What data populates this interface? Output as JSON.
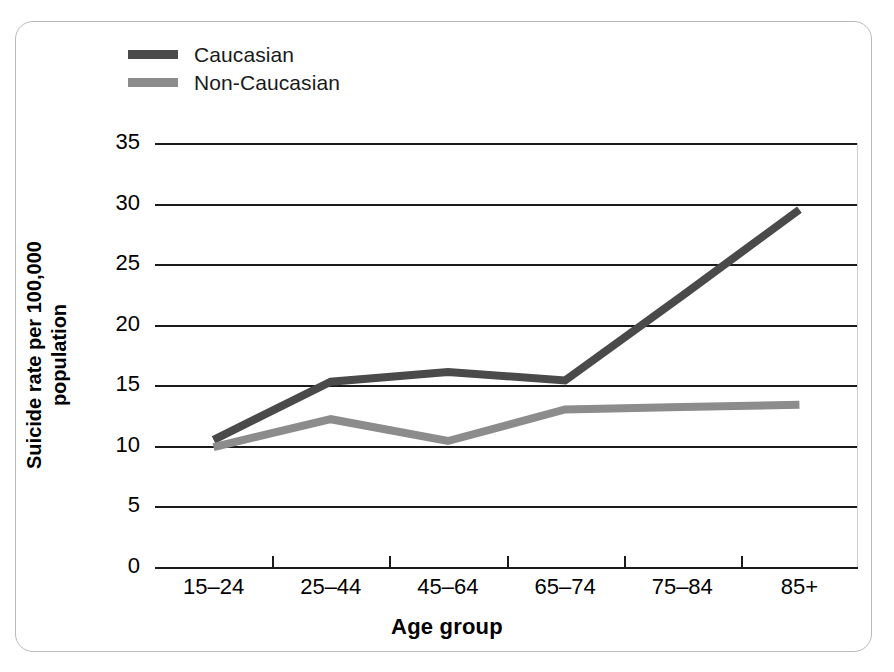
{
  "figure": {
    "border_color": "#b9b9b9",
    "background": "#ffffff"
  },
  "legend": {
    "position": "top-left inside plot",
    "entries": [
      {
        "label": "Caucasian",
        "color": "#4a4a4a",
        "swatch": "legend-swatch-caucasian"
      },
      {
        "label": "Non-Caucasian",
        "color": "#8c8c8c",
        "swatch": "legend-swatch-non-caucasian"
      }
    ]
  },
  "axes": {
    "x_title": "Age group",
    "y_title_line1": "Suicide rate per 100,000",
    "y_title_line2": "population",
    "y_ticks": [
      "35",
      "30",
      "25",
      "20",
      "15",
      "10",
      "5",
      "0"
    ],
    "x_ticks": [
      "15–24",
      "25–44",
      "45–64",
      "65–74",
      "75–84",
      "85+"
    ]
  },
  "chart_data": {
    "type": "line",
    "title": "",
    "xlabel": "Age group",
    "ylabel": "Suicide rate per 100,000 population",
    "categories": [
      "15–24",
      "25–44",
      "45–64",
      "65–74",
      "75–84",
      "85+"
    ],
    "ylim": [
      0,
      35
    ],
    "ytick_step": 5,
    "grid": "horizontal",
    "legend_position": "top-left",
    "series": [
      {
        "name": "Caucasian",
        "color": "#4a4a4a",
        "values": [
          10.5,
          15.3,
          16.1,
          15.4,
          22.4,
          29.5
        ]
      },
      {
        "name": "Non-Caucasian",
        "color": "#8c8c8c",
        "values": [
          9.9,
          12.2,
          10.4,
          13.0,
          13.2,
          13.4
        ]
      }
    ]
  }
}
